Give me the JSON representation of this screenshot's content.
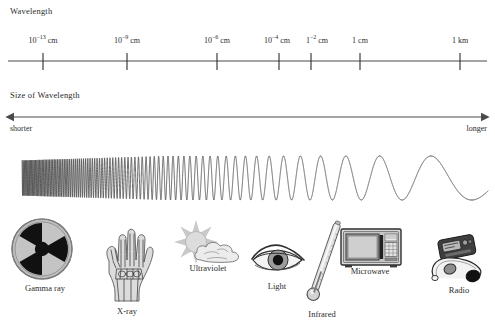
{
  "diagram": {
    "background_color": "#ffffff",
    "ink_color": "#2b2b2b"
  },
  "wavelength_axis": {
    "heading": "Wavelength",
    "ticks": [
      {
        "label_base": "10",
        "exponent": "−13",
        "unit": " cm",
        "x": 43
      },
      {
        "label_base": "10",
        "exponent": "−9",
        "unit": " cm",
        "x": 127
      },
      {
        "label_base": "10",
        "exponent": "−6",
        "unit": " cm",
        "x": 217
      },
      {
        "label_base": "10",
        "exponent": "−4",
        "unit": " cm",
        "x": 279
      },
      {
        "label_base": "1",
        "exponent": "−2",
        "unit": " cm",
        "x": 311
      },
      {
        "label_base": "1",
        "exponent": "",
        "unit": " cm",
        "x": 360
      },
      {
        "label_base": "1",
        "exponent": "",
        "unit": " km",
        "x": 460
      }
    ],
    "line": {
      "x1": 8,
      "x2": 487,
      "y": 61
    }
  },
  "size_axis": {
    "heading": "Size of Wavelength",
    "left_label": "shorter",
    "right_label": "longer",
    "arrow": {
      "x1": 12,
      "x2": 483,
      "y": 117
    }
  },
  "wave": {
    "description": "sine wave with wavelength increasing left to right",
    "x_start": 22,
    "x_end": 488,
    "y_center": 178,
    "amplitude": 22
  },
  "devices": [
    {
      "name": "gamma-ray",
      "label": "Gamma ray",
      "icon": "radiation-trefoil-icon",
      "label_x": 45,
      "label_y": 290
    },
    {
      "name": "x-ray",
      "label": "X-ray",
      "icon": "hand-xray-icon",
      "label_x": 127,
      "label_y": 313
    },
    {
      "name": "ultraviolet",
      "label": "Ultraviolet",
      "icon": "sun-cloud-icon",
      "label_x": 208,
      "label_y": 270
    },
    {
      "name": "light",
      "label": "Light",
      "icon": "eye-icon",
      "label_x": 277,
      "label_y": 288
    },
    {
      "name": "infrared",
      "label": "Infrared",
      "icon": "thermometer-icon",
      "label_x": 320,
      "label_y": 316
    },
    {
      "name": "microwave",
      "label": "Microwave",
      "icon": "microwave-oven-icon",
      "label_x": 370,
      "label_y": 273
    },
    {
      "name": "radio",
      "label": "Radio",
      "icon": "portable-radio-headphones-icon",
      "label_x": 458,
      "label_y": 292
    }
  ],
  "colors": {
    "line": "#4a4a4a",
    "trefoil_disc": "#b9b9b9",
    "trefoil_mark": "#111111",
    "device_gray": "#9a9a9a",
    "device_light_gray": "#d2d2d2",
    "device_dark": "#3a3a3a"
  }
}
